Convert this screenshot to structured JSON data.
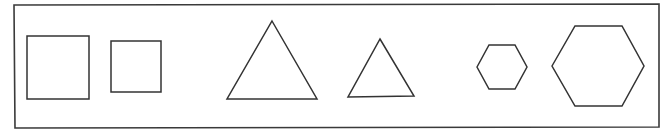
{
  "figure": {
    "stroke_color": "#333333",
    "background_color": "#ffffff",
    "frame": {
      "points": "14,5 659,4 659,127 15,128"
    },
    "shapes": [
      {
        "id": "square-large",
        "kind": "square",
        "size": "large",
        "points": "27,36 89,36 89,99 27,99"
      },
      {
        "id": "square-small",
        "kind": "square",
        "size": "small",
        "points": "111,41 161,41 161,92 111,92"
      },
      {
        "id": "triangle-large",
        "kind": "triangle",
        "size": "large",
        "points": "272,21 317,99 227,99"
      },
      {
        "id": "triangle-small",
        "kind": "triangle",
        "size": "small",
        "points": "380,39 414,96 348,97"
      },
      {
        "id": "hexagon-small",
        "kind": "hexagon",
        "size": "small",
        "points": "477,67 489,45 515,45 527,67 515,89 489,89"
      },
      {
        "id": "hexagon-large",
        "kind": "hexagon",
        "size": "large",
        "points": "552,66 575,26 622,26 644,66 622,106 575,106"
      }
    ]
  }
}
